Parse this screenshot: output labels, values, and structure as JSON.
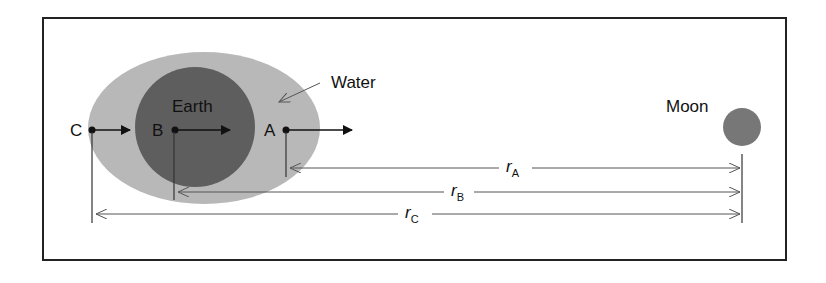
{
  "colors": {
    "frame": "#222222",
    "water": "#b8b8b8",
    "earth": "#5e5e5e",
    "moon": "#777777",
    "dim_line": "#555555",
    "text": "#111111"
  },
  "labels": {
    "water": "Water",
    "earth": "Earth",
    "moon": "Moon",
    "point_a": "A",
    "point_b": "B",
    "point_c": "C"
  },
  "distances": {
    "r_a": {
      "symbol": "r",
      "subscript": "A"
    },
    "r_b": {
      "symbol": "r",
      "subscript": "B"
    },
    "r_c": {
      "symbol": "r",
      "subscript": "C"
    }
  }
}
